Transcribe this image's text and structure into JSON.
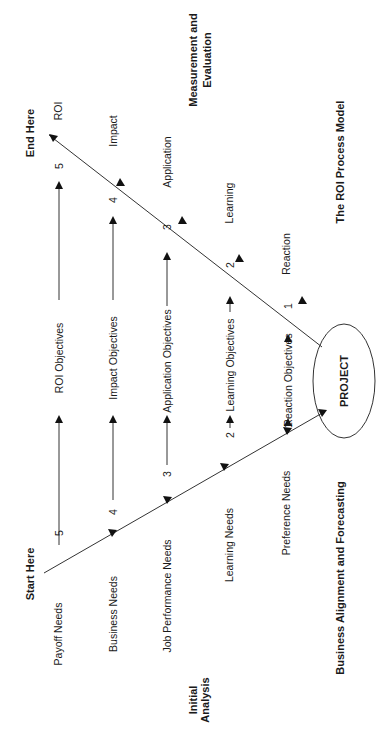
{
  "diagram": {
    "title": "The ROI Process Model",
    "orientation": "rotated-90-ccw",
    "start_label": "Start Here",
    "end_label": "End Here",
    "center_node": "PROJECT",
    "section_labels": {
      "initial_analysis": [
        "Initial",
        "Analysis"
      ],
      "measurement": [
        "Measurement and",
        "Evaluation"
      ],
      "alignment": "Business Alignment and Forecasting"
    },
    "needs": [
      {
        "level": "5",
        "label": "Payoff Needs"
      },
      {
        "level": "4",
        "label": "Business Needs"
      },
      {
        "level": "3",
        "label": "Job Performance Needs"
      },
      {
        "level": "2",
        "label": "Learning Needs"
      },
      {
        "level": "1",
        "label": "Preference Needs"
      }
    ],
    "objectives": [
      {
        "level": "5",
        "label": "ROI Objectives"
      },
      {
        "level": "4",
        "label": "Impact Objectives"
      },
      {
        "level": "3",
        "label": "Application Objectives"
      },
      {
        "level": "2",
        "label": "Learning Objectives"
      },
      {
        "level": "1",
        "label": "Reaction Objectives"
      }
    ],
    "evaluation": [
      {
        "level": "5",
        "label": "ROI"
      },
      {
        "level": "4",
        "label": "Impact"
      },
      {
        "level": "3",
        "label": "Application"
      },
      {
        "level": "2",
        "label": "Learning"
      },
      {
        "level": "1",
        "label": "Reaction"
      }
    ]
  }
}
